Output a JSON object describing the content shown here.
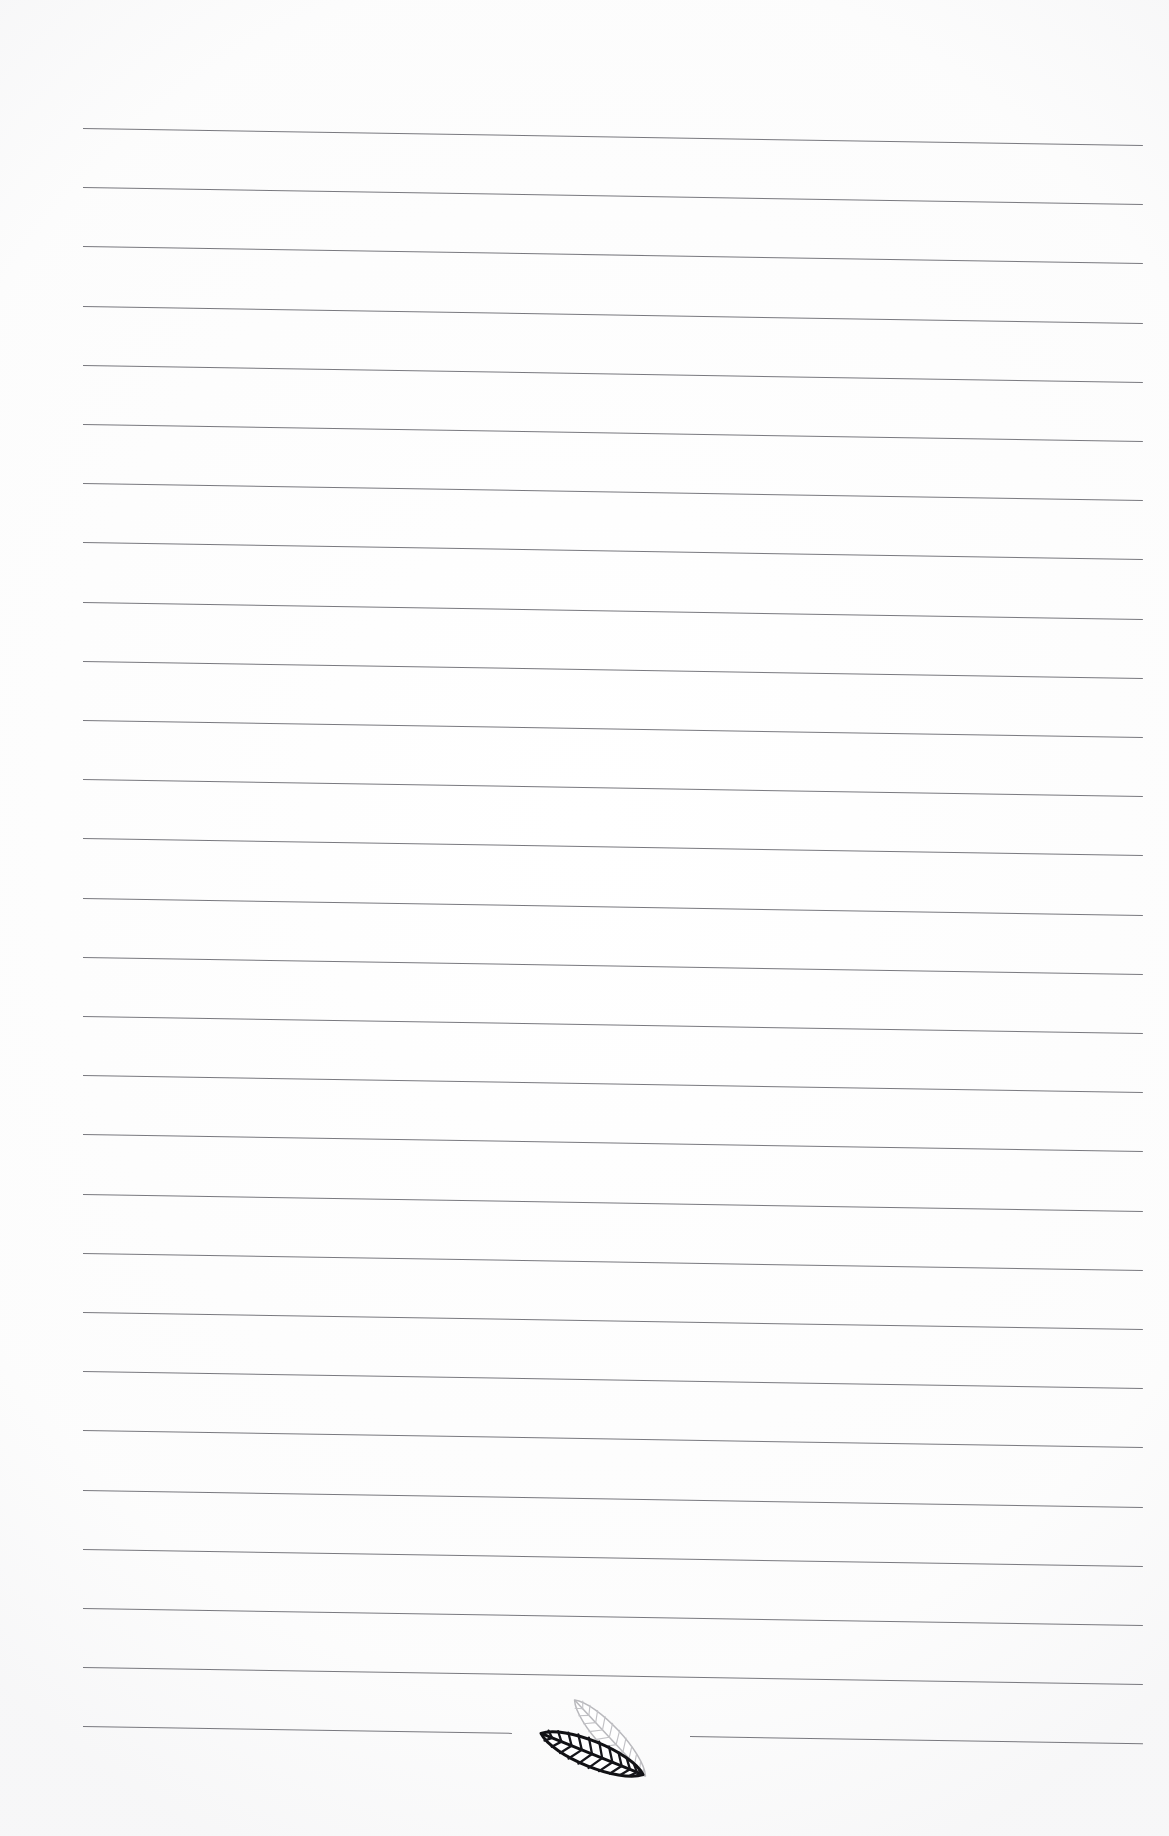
{
  "document": {
    "kind": "scanned-lined-notepaper",
    "page_width": 1169,
    "page_height": 1836,
    "background_color": "#ffffff",
    "content_text": "",
    "orientation": "portrait"
  },
  "ruling": {
    "line_color": "#6d6d73",
    "line_count": 28,
    "line_thickness_px": 1.4,
    "first_line_y": 128,
    "line_spacing_px": 59.2,
    "left_margin_x": 83,
    "right_margin_x": 1143,
    "tilt_degrees": 0.92,
    "tilt_note": "lines slope down to the right from the scan skew",
    "interrupted_line_index": 27,
    "interrupted_gap": {
      "start_x": 512,
      "end_x": 690
    }
  },
  "emblem": {
    "name": "two-leaf-mark",
    "position": {
      "x": 528,
      "y": 1682,
      "width": 150,
      "height": 115
    },
    "front_leaf": {
      "name": "dark-leaf",
      "stroke_color": "#111114",
      "fill_color": "#ffffff",
      "rotation_degrees": 22,
      "vein_count": 11
    },
    "back_leaf": {
      "name": "light-leaf",
      "stroke_color": "#b9b9bd",
      "fill_color": "#ffffff",
      "rotation_degrees": 47,
      "vein_count": 11
    }
  }
}
